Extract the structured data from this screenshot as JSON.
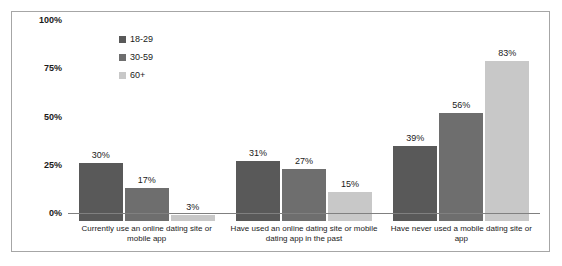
{
  "chart_data": {
    "type": "bar",
    "title": "",
    "subtitle": "",
    "xlabel": "",
    "ylabel": "",
    "ylim": [
      0,
      100
    ],
    "grid": false,
    "legend_position": "top-left",
    "y_ticks": [
      "0%",
      "25%",
      "50%",
      "75%",
      "100%"
    ],
    "y_tick_values": [
      0,
      25,
      50,
      75,
      100
    ],
    "categories": [
      "Currently use an online dating site or mobile app",
      "Have used an online dating site or mobile dating app in the past",
      "Have never used a mobile dating site or app"
    ],
    "series": [
      {
        "name": "18-29",
        "color": "#595959",
        "values": [
          30,
          31,
          39
        ],
        "labels": [
          "30%",
          "31%",
          "39%"
        ]
      },
      {
        "name": "30-59",
        "color": "#6e6e6e",
        "values": [
          17,
          27,
          56
        ],
        "labels": [
          "17%",
          "27%",
          "56%"
        ]
      },
      {
        "name": "60+",
        "color": "#c8c8c8",
        "values": [
          3,
          15,
          83
        ],
        "labels": [
          "3%",
          "15%",
          "83%"
        ]
      }
    ]
  },
  "frame": {
    "border_color": "#a6a6a6",
    "background": "#ffffff",
    "axis_color": "#808080"
  }
}
